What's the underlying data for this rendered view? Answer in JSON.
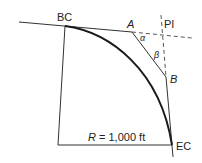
{
  "diagram": {
    "type": "horizontal curve geometry",
    "labels": {
      "bc": "BC",
      "pi": "PI",
      "ec": "EC",
      "point_a": "A",
      "point_b": "B",
      "alpha": "α",
      "beta": "β",
      "radius": "R = 1,000 ft"
    },
    "colors": {
      "line": "#333333",
      "curve": "#1a1a1a",
      "background": "#ffffff"
    }
  }
}
